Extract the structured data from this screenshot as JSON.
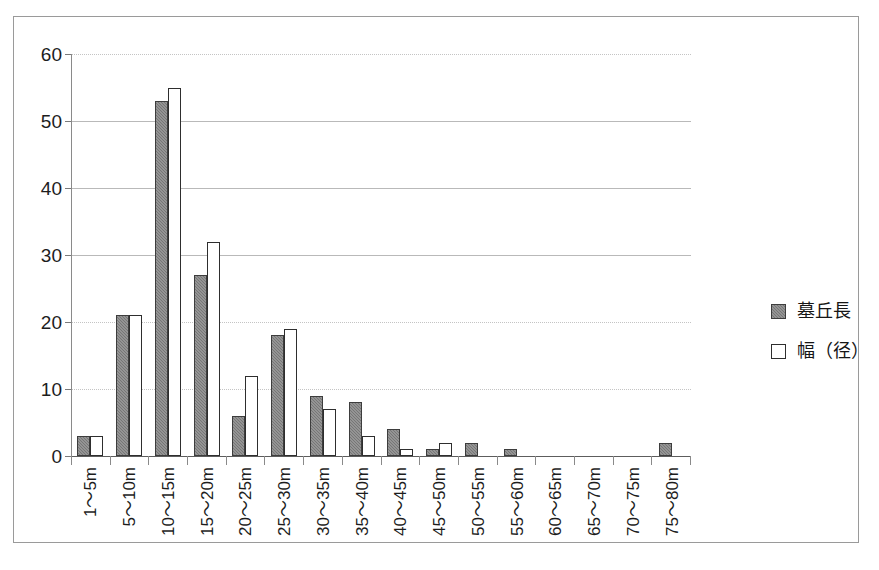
{
  "chart_data": {
    "type": "bar",
    "title": "",
    "xlabel": "",
    "ylabel": "",
    "ylim": [
      0,
      60
    ],
    "yticks": [
      0,
      10,
      20,
      30,
      40,
      50,
      60
    ],
    "grid": true,
    "legend_position": "right",
    "categories": [
      "1～5m",
      "5～10m",
      "10～15m",
      "15～20m",
      "20～25m",
      "25～30m",
      "30～35m",
      "35～40m",
      "40～45m",
      "45～50m",
      "50～55m",
      "55～60m",
      "60～65m",
      "65～70m",
      "70～75m",
      "75～80m"
    ],
    "series": [
      {
        "name": "墓丘長",
        "color": "#767676",
        "values": [
          3,
          21,
          53,
          27,
          6,
          18,
          9,
          8,
          4,
          1,
          2,
          1,
          0,
          0,
          0,
          2
        ]
      },
      {
        "name": "幅（径）",
        "color": "#ffffff",
        "values": [
          3,
          21,
          55,
          32,
          12,
          19,
          7,
          3,
          1,
          2,
          0,
          0,
          0,
          0,
          0,
          0
        ]
      }
    ]
  },
  "legend": {
    "items": [
      {
        "label": "墓丘長"
      },
      {
        "label": "幅（径）"
      }
    ]
  },
  "axis": {
    "ytick_labels": [
      "60",
      "50",
      "40",
      "30",
      "20",
      "10",
      "0"
    ]
  }
}
